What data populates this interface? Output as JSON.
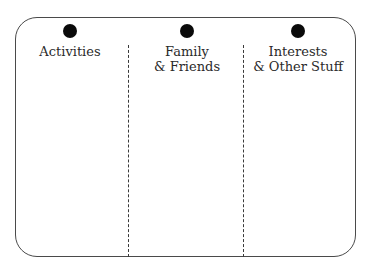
{
  "diagram": {
    "type": "three-column organizer",
    "columns": [
      {
        "line1": "Activities",
        "line2": ""
      },
      {
        "line1": "Family",
        "line2": "& Friends"
      },
      {
        "line1": "Interests",
        "line2": "& Other Stuff"
      }
    ],
    "colors": {
      "border": "#4a4a4a",
      "divider": "#3a3a3a",
      "dot": "#0a0a0a",
      "background": "#ffffff"
    }
  }
}
